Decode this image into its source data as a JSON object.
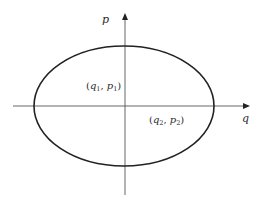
{
  "diagram": {
    "type": "phase-space ellipse",
    "colors": {
      "ellipse": "#222222",
      "axis": "#555555",
      "text": "#2a2a2a",
      "background": "#ffffff"
    },
    "axes": {
      "horizontal_label": "q",
      "vertical_label": "p"
    },
    "ellipse": {
      "cx": 124,
      "cy": 106,
      "rx": 90,
      "ry": 60
    },
    "points": [
      {
        "id": "point-1",
        "open": "(",
        "var_a": "q",
        "sub_a": "1",
        "sep": ", ",
        "var_b": "p",
        "sub_b": "1",
        "close": ")"
      },
      {
        "id": "point-2",
        "open": "(",
        "var_a": "q",
        "sub_a": "2",
        "sep": ", ",
        "var_b": "p",
        "sub_b": "2",
        "close": ")"
      }
    ]
  }
}
